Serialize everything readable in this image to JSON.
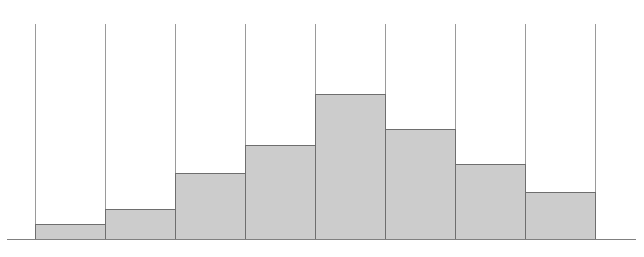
{
  "chart_data": {
    "type": "bar",
    "title": "",
    "subtitle": "",
    "xlabel": "",
    "ylabel": "",
    "categories": [
      "1",
      "2",
      "3",
      "4",
      "5",
      "6",
      "7",
      "8"
    ],
    "values": [
      15,
      30,
      66,
      94,
      145,
      110,
      75,
      47
    ],
    "ylim": [
      0,
      215
    ],
    "xlim": [
      0,
      8
    ],
    "grid": true,
    "grid_orientation": "vertical",
    "legend": null,
    "legend_position": "none",
    "tick_labels_x": [],
    "tick_labels_y": [],
    "annotations": [],
    "bar_fill_color": "#cccccc",
    "bar_edge_color": "#6e6e6e",
    "grid_line_color": "#9a9a9a",
    "axis_line_color": "#808080",
    "background_color": "#ffffff",
    "bar_count": 8,
    "grid_line_count": 9
  },
  "geometry": {
    "canvas_width": 644,
    "canvas_height": 257,
    "plot_left": 35,
    "plot_right": 595,
    "baseline_y": 239,
    "grid_top_y": 24,
    "bar_width": 70,
    "bar_left_edges": [
      35,
      105,
      175,
      245,
      315,
      385,
      455,
      525
    ],
    "bar_top_y": [
      224,
      209,
      173,
      145,
      94,
      129,
      164,
      192
    ],
    "grid_x": [
      35,
      105,
      175,
      245,
      315,
      385,
      455,
      525,
      595
    ],
    "axis_x_start": 7,
    "axis_x_end": 636
  }
}
